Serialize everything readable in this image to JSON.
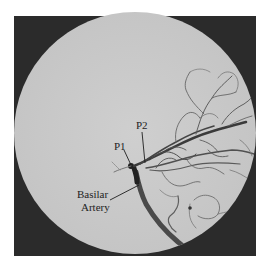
{
  "figure": {
    "type": "cerebral angiogram",
    "background_color": "#ffffff",
    "frame_color": "#2b2b2b",
    "field_color": "#c9c9c9",
    "vessel_color": "#3a3a3a"
  },
  "labels": {
    "p1": "P1",
    "p2": "P2",
    "basilar_line1": "Basilar",
    "basilar_line2": "Artery"
  }
}
